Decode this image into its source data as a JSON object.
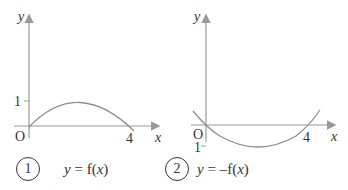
{
  "graphs": [
    {
      "option_number": "1",
      "equation": {
        "y": "y",
        "equals": " = ",
        "func": "f(",
        "x": "x",
        "close": ")"
      },
      "axis_labels": {
        "x": "x",
        "y": "y"
      },
      "origin": "O",
      "x_tick": "4",
      "y_tick": "1",
      "description": "Arch through (0,0) with maximum y=1 at x=2, crossing x-axis at 4"
    },
    {
      "option_number": "2",
      "equation": {
        "y": "y",
        "equals": " = ",
        "func": "–f(",
        "x": "x",
        "close": ")"
      },
      "axis_labels": {
        "x": "x",
        "y": "y"
      },
      "origin": "O",
      "x_tick": "4",
      "y_tick": "1",
      "description": "Reflection in x-axis: U-shape through (0,0) with minimum y=-1 at x=2, crossing x-axis at 4"
    }
  ],
  "colors": {
    "axis": "#9a9a9a",
    "curve": "#8e8e8e",
    "text": "#333333"
  }
}
